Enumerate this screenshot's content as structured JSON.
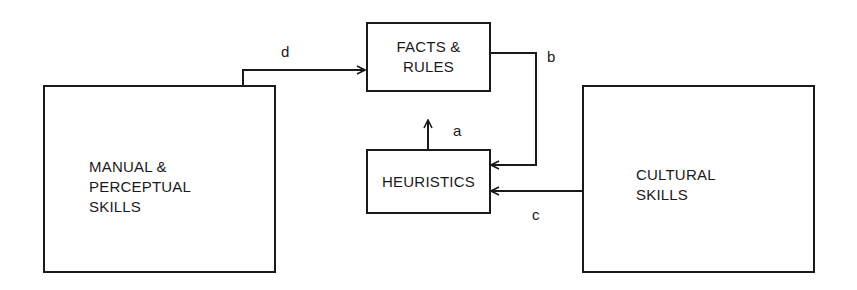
{
  "diagram": {
    "nodes": [
      {
        "id": "manual",
        "line1": "MANUAL &",
        "line2": "PERCEPTUAL",
        "line3": "SKILLS"
      },
      {
        "id": "facts",
        "line1": "FACTS &",
        "line2": "RULES"
      },
      {
        "id": "heuristics",
        "line1": "HEURISTICS"
      },
      {
        "id": "cultural",
        "line1": "CULTURAL",
        "line2": "SKILLS"
      }
    ],
    "edges": [
      {
        "label": "a",
        "from": "HEURISTICS",
        "to": "FACTS & RULES"
      },
      {
        "label": "b",
        "from": "FACTS & RULES",
        "to": "HEURISTICS"
      },
      {
        "label": "c",
        "from": "CULTURAL SKILLS",
        "to": "HEURISTICS"
      },
      {
        "label": "d",
        "from": "MANUAL & PERCEPTUAL SKILLS",
        "to": "FACTS & RULES"
      }
    ]
  }
}
